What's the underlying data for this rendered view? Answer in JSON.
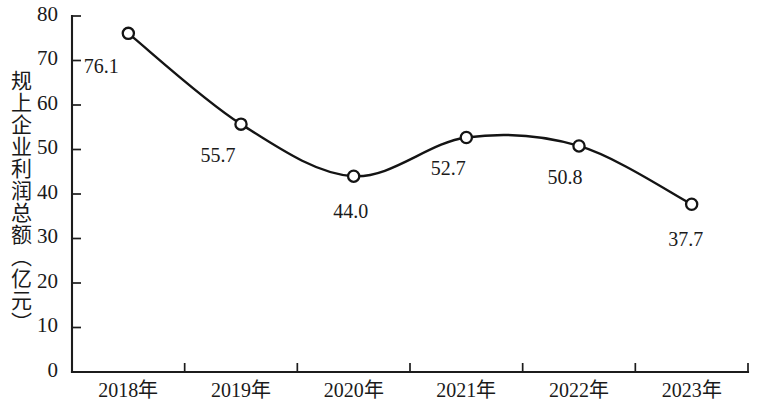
{
  "chart_data": {
    "type": "line",
    "title": "",
    "subtitle": "",
    "xlabel": "",
    "ylabel": "规上企业利润总额（亿元）",
    "categories": [
      "2018年",
      "2019年",
      "2020年",
      "2021年",
      "2022年",
      "2023年"
    ],
    "values": [
      76.1,
      55.7,
      44.0,
      52.7,
      50.8,
      37.7
    ],
    "point_labels": [
      "76.1",
      "55.7",
      "44.0",
      "52.7",
      "50.8",
      "37.7"
    ],
    "series": [
      {
        "name": "规上企业利润总额",
        "values": [
          76.1,
          55.7,
          44.0,
          52.7,
          50.8,
          37.7
        ]
      }
    ],
    "ylim": [
      0,
      80
    ],
    "ytick_values": [
      0,
      10,
      20,
      30,
      40,
      50,
      60,
      70,
      80
    ],
    "ytick_labels": [
      "0",
      "10",
      "20",
      "30",
      "40",
      "50",
      "60",
      "70",
      "80"
    ],
    "grid": false,
    "legend": false,
    "legend_position": "none",
    "marker": "open-circle",
    "line_color": "#141414",
    "marker_fill": "#ffffff",
    "background_color": "#ffffff",
    "smoothing": "spline"
  }
}
